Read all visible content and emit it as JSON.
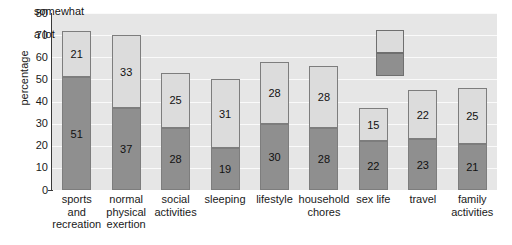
{
  "chart_data": {
    "type": "bar",
    "subtype": "stacked-vertical",
    "title": "",
    "xlabel": "",
    "ylabel": "percentage",
    "ylim": [
      0,
      80
    ],
    "ytick_step": 10,
    "yticks": [
      0,
      10,
      20,
      30,
      40,
      50,
      60,
      70,
      80
    ],
    "grid": true,
    "grid_orientation": "horizontal",
    "legend_position": "inside-top-right",
    "categories": [
      "sports and recreation",
      "normal physical exertion",
      "social activities",
      "sleeping",
      "lifestyle",
      "household chores",
      "sex life",
      "travel",
      "family activities"
    ],
    "category_label_lines": [
      [
        "sports",
        "and",
        "recreation"
      ],
      [
        "normal",
        "physical",
        "exertion"
      ],
      [
        "social",
        "activities"
      ],
      [
        "sleeping"
      ],
      [
        "lifestyle"
      ],
      [
        "household",
        "chores"
      ],
      [
        "sex life"
      ],
      [
        "travel"
      ],
      [
        "family",
        "activities"
      ]
    ],
    "series": [
      {
        "name": "a lot",
        "color": "#8f8f8f",
        "values": [
          51,
          37,
          28,
          19,
          30,
          28,
          22,
          23,
          21
        ]
      },
      {
        "name": "somewhat",
        "color": "#dcdcdc",
        "values": [
          21,
          33,
          25,
          31,
          28,
          28,
          15,
          22,
          25
        ]
      }
    ],
    "totals": [
      72,
      70,
      53,
      50,
      58,
      56,
      37,
      45,
      46
    ],
    "value_labels_shown": true
  },
  "legend": {
    "entries": [
      {
        "label": "somewhat",
        "color": "#dcdcdc"
      },
      {
        "label": "a lot",
        "color": "#8f8f8f"
      }
    ]
  },
  "colors": {
    "plot_background": "#e6e6e6",
    "gridline": "#fafafa",
    "axis": "#3a3a3a",
    "bar_border": "#7d7d7d",
    "text": "#1a1a1a"
  }
}
